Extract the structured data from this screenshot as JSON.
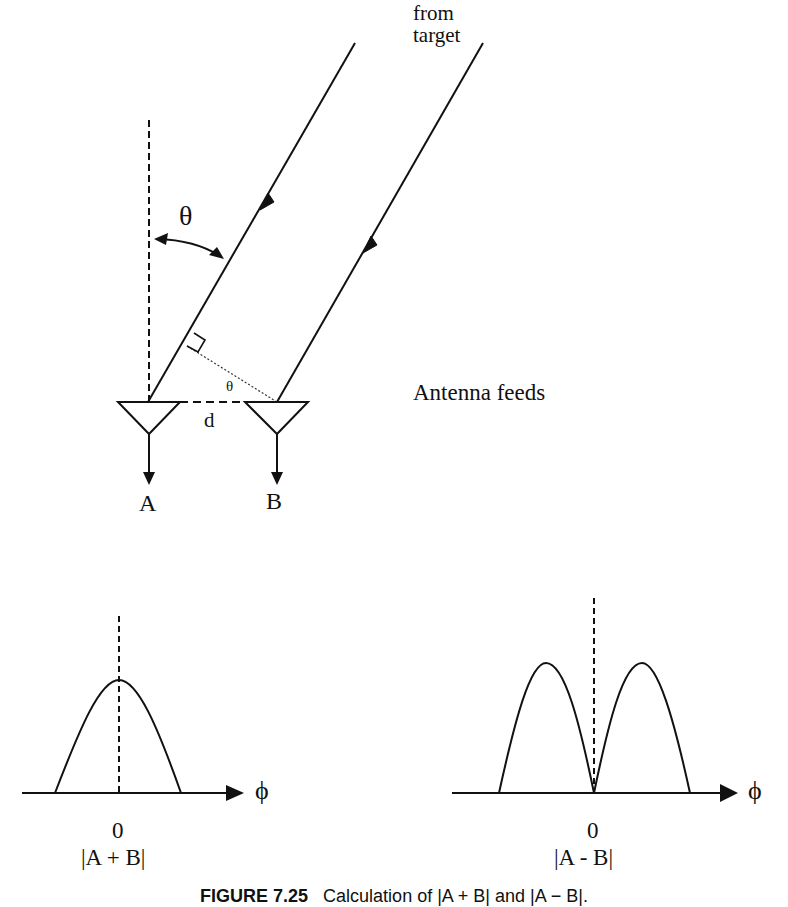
{
  "diagram": {
    "title_text": "from target",
    "from_target_line1": "from",
    "from_target_line2": "target",
    "angle_label": "θ",
    "angle_label_small": "θ",
    "spacing_label": "d",
    "antenna_a_label": "A",
    "antenna_b_label": "B",
    "antenna_feeds_label": "Antenna feeds",
    "sum_pattern": {
      "axis_label": "ϕ",
      "origin_label": "0",
      "label": "|A + B|"
    },
    "difference_pattern": {
      "axis_label": "ϕ",
      "origin_label": "0",
      "label": "|A - B|"
    },
    "caption_figure": "FIGURE 7.25",
    "caption_text": "Calculation of |A + B| and |A − B|.",
    "colors": {
      "stroke": "#111111",
      "background": "#ffffff"
    }
  }
}
